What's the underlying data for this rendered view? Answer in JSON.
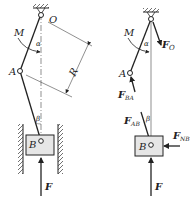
{
  "figure": {
    "left": {
      "title": "mechanism",
      "labels": {
        "O": "O",
        "A": "A",
        "B": "B",
        "M": "M",
        "alpha": "α",
        "beta": "β",
        "R": "R",
        "F": "F"
      }
    },
    "right": {
      "title": "free-body diagram",
      "labels": {
        "M": "M",
        "alpha": "α",
        "beta": "β",
        "A": "A",
        "B": "B",
        "F": "F",
        "FO_main": "F",
        "FO_sub": "O",
        "FBA_main": "F",
        "FBA_sub": "BA",
        "FAB_main": "F",
        "FAB_sub": "AB",
        "FNB_main": "F",
        "FNB_sub": "NB"
      }
    },
    "colors": {
      "line": "#222222",
      "block_fill": "#e6e6e6",
      "background": "#ffffff"
    }
  }
}
